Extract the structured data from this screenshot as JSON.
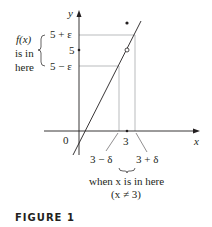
{
  "figure": {
    "caption": "FIGURE 1",
    "axes": {
      "x_label": "x",
      "y_label": "y",
      "origin_label": "0"
    },
    "y_ticks": {
      "upper": "5 + ε",
      "center": "5",
      "lower": "5 − ε"
    },
    "x_ticks": {
      "left": "3 − δ",
      "center": "3",
      "right": "3 + δ"
    },
    "left_annotation": [
      "f(x)",
      "is in",
      "here"
    ],
    "bottom_annotation": [
      "when x is in here",
      "(x ≠ 3)"
    ],
    "colors": {
      "ink": "#231f20",
      "guide": "#a7a9ac"
    }
  }
}
